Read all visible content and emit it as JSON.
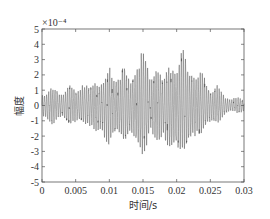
{
  "chart_data": {
    "type": "line",
    "title": "",
    "xlabel": "时间/s",
    "ylabel": "幅度",
    "y_exponent_label": "×10⁻⁴",
    "xlim": [
      0,
      0.03
    ],
    "ylim": [
      -5,
      5
    ],
    "xticks": [
      0,
      0.005,
      0.01,
      0.015,
      0.02,
      0.025,
      0.03
    ],
    "xtick_labels": [
      "0",
      "0.005",
      "0.01",
      "0.015",
      "0.02",
      "0.025",
      "0.03"
    ],
    "yticks": [
      5,
      4,
      3,
      2,
      1,
      0,
      -1,
      -2,
      -3,
      -4,
      -5
    ],
    "ytick_labels": [
      "5",
      "4",
      "3",
      "2",
      "1",
      "0",
      "-1",
      "-2",
      "-3",
      "-4",
      "-5"
    ],
    "grid": false,
    "legend": null,
    "series": [
      {
        "name": "signal",
        "color": "#333333",
        "description": "Oscillatory vibration signal in units of 1e-4; envelope peaks (positive/negative) listed per time",
        "envelope": {
          "t": [
            0.0,
            0.001,
            0.002,
            0.003,
            0.004,
            0.005,
            0.006,
            0.007,
            0.008,
            0.009,
            0.01,
            0.011,
            0.012,
            0.013,
            0.014,
            0.015,
            0.016,
            0.017,
            0.018,
            0.019,
            0.02,
            0.021,
            0.022,
            0.023,
            0.024,
            0.025,
            0.026,
            0.027,
            0.028,
            0.029,
            0.03
          ],
          "pos": [
            1.0,
            1.0,
            1.4,
            1.0,
            1.5,
            1.2,
            1.8,
            1.2,
            2.2,
            1.8,
            2.7,
            2.2,
            3.2,
            1.7,
            3.5,
            4.2,
            2.2,
            3.5,
            1.5,
            3.8,
            3.0,
            4.0,
            3.3,
            2.2,
            2.3,
            1.2,
            1.5,
            0.8,
            0.6,
            0.6,
            0.4
          ],
          "neg": [
            -1.0,
            -1.2,
            -1.3,
            -1.0,
            -1.3,
            -1.4,
            -1.6,
            -1.3,
            -2.6,
            -2.2,
            -2.9,
            -2.5,
            -2.7,
            -2.0,
            -3.3,
            -3.7,
            -2.0,
            -3.4,
            -1.9,
            -3.8,
            -3.4,
            -3.3,
            -3.5,
            -2.4,
            -1.8,
            -1.5,
            -1.3,
            -0.8,
            -0.5,
            -0.5,
            -0.5
          ]
        }
      }
    ]
  }
}
